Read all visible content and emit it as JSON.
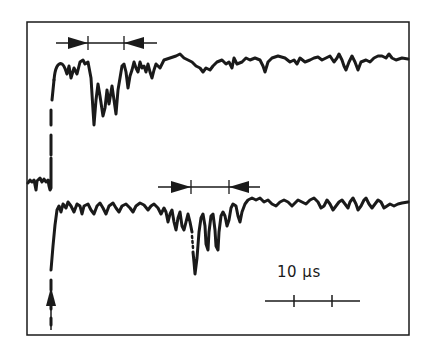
{
  "figure": {
    "type": "oscilloscope-trace-diagram",
    "traces": [
      {
        "name": "upper-trace",
        "description": "signal with step rise then dip cluster between arrow markers, then noisy baseline"
      },
      {
        "name": "lower-trace",
        "description": "signal with step rise then flat noisy baseline, dip cluster later between arrow markers"
      }
    ],
    "markers": {
      "upper_interval": {
        "description": "double arrow interval with two ticks"
      },
      "lower_interval": {
        "description": "double arrow interval with two ticks"
      },
      "trigger_arrow": {
        "description": "upward arrow at trigger time"
      }
    },
    "scale_bar": {
      "label": "10 µs"
    },
    "colors": {
      "ink": "#1a1a1a",
      "background": "#ffffff"
    }
  }
}
